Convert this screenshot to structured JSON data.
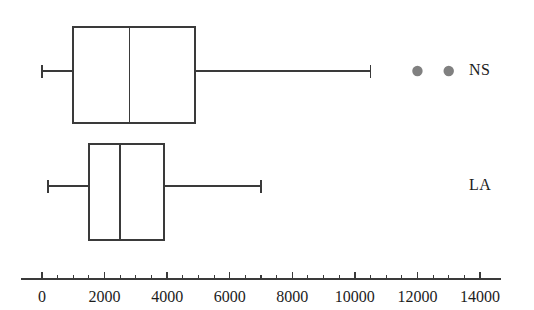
{
  "figure": {
    "width": 534,
    "height": 310,
    "background": "#ffffff",
    "line_color": "#3a3a3a",
    "outlier_color": "#808080",
    "text_color": "#1c1c1c"
  },
  "chart_data": {
    "type": "box",
    "orientation": "horizontal",
    "title": "",
    "xlabel": "",
    "ylabel": "",
    "xlim": [
      0,
      14000
    ],
    "grid": false,
    "legend": null,
    "categories": [
      "NS",
      "LA"
    ],
    "xticks": [
      0,
      2000,
      4000,
      6000,
      8000,
      10000,
      12000,
      14000
    ],
    "xticklabels": [
      "0",
      "2000",
      "4000",
      "6000",
      "8000",
      "10000",
      "12000",
      "14000"
    ],
    "minor_ticks_between_majors": 3,
    "boxes": [
      {
        "label": "NS",
        "whisker_low": 0,
        "q1": 1000,
        "median": 2800,
        "q3": 4900,
        "whisker_high": 10500,
        "outliers": [
          12000,
          13000
        ]
      },
      {
        "label": "LA",
        "whisker_low": 200,
        "q1": 1500,
        "median": 2500,
        "q3": 3900,
        "whisker_high": 7000,
        "outliers": []
      }
    ]
  }
}
